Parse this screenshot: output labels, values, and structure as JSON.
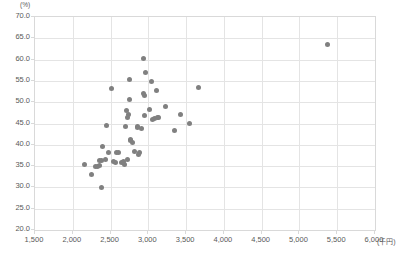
{
  "chart": {
    "type": "scatter",
    "y_unit_label": "(%)",
    "x_unit_label": "(千円)"
  },
  "chart_data": {
    "type": "scatter",
    "title": "",
    "xlabel": "(千円)",
    "ylabel": "(%)",
    "xlim": [
      1500,
      6000
    ],
    "ylim": [
      20.0,
      70.0
    ],
    "xticks": [
      1500,
      2000,
      2500,
      3000,
      3500,
      4000,
      4500,
      5000,
      5500,
      6000
    ],
    "xtick_labels": [
      "1,500",
      "2,000",
      "2,500",
      "3,000",
      "3,500",
      "4,000",
      "4,500",
      "5,000",
      "5,500",
      "6,000"
    ],
    "yticks": [
      20.0,
      25.0,
      30.0,
      35.0,
      40.0,
      45.0,
      50.0,
      55.0,
      60.0,
      65.0,
      70.0
    ],
    "ytick_labels": [
      "20.0",
      "25.0",
      "30.0",
      "35.0",
      "40.0",
      "45.0",
      "50.0",
      "55.0",
      "60.0",
      "65.0",
      "70.0"
    ],
    "grid": true,
    "legend": false,
    "marker_color": "#808080",
    "series": [
      {
        "name": "observations",
        "points": [
          [
            2160,
            35.3
          ],
          [
            2245,
            33.0
          ],
          [
            2300,
            35.0
          ],
          [
            2330,
            35.0
          ],
          [
            2355,
            35.1
          ],
          [
            2360,
            36.3
          ],
          [
            2375,
            36.2
          ],
          [
            2380,
            30.0
          ],
          [
            2395,
            39.5
          ],
          [
            2430,
            36.6
          ],
          [
            2440,
            44.5
          ],
          [
            2470,
            38.2
          ],
          [
            2510,
            53.1
          ],
          [
            2540,
            36.0
          ],
          [
            2560,
            35.9
          ],
          [
            2575,
            38.2
          ],
          [
            2600,
            38.1
          ],
          [
            2640,
            35.9
          ],
          [
            2665,
            36.0
          ],
          [
            2690,
            35.3
          ],
          [
            2700,
            44.4
          ],
          [
            2705,
            48.0
          ],
          [
            2720,
            36.6
          ],
          [
            2730,
            46.5
          ],
          [
            2740,
            47.0
          ],
          [
            2745,
            55.3
          ],
          [
            2750,
            50.6
          ],
          [
            2760,
            41.0
          ],
          [
            2765,
            41.3
          ],
          [
            2790,
            40.6
          ],
          [
            2820,
            38.5
          ],
          [
            2850,
            44.0
          ],
          [
            2860,
            44.2
          ],
          [
            2870,
            37.8
          ],
          [
            2880,
            38.2
          ],
          [
            2910,
            43.9
          ],
          [
            2930,
            60.3
          ],
          [
            2940,
            52.1
          ],
          [
            2945,
            51.6
          ],
          [
            2950,
            46.8
          ],
          [
            2960,
            56.9
          ],
          [
            3010,
            48.4
          ],
          [
            3040,
            54.8
          ],
          [
            3060,
            46.0
          ],
          [
            3080,
            46.2
          ],
          [
            3110,
            52.7
          ],
          [
            3120,
            46.4
          ],
          [
            3140,
            46.3
          ],
          [
            3230,
            49.0
          ],
          [
            3340,
            43.4
          ],
          [
            3430,
            47.2
          ],
          [
            3540,
            45.0
          ],
          [
            3670,
            53.4
          ],
          [
            5370,
            63.6
          ]
        ]
      }
    ]
  }
}
